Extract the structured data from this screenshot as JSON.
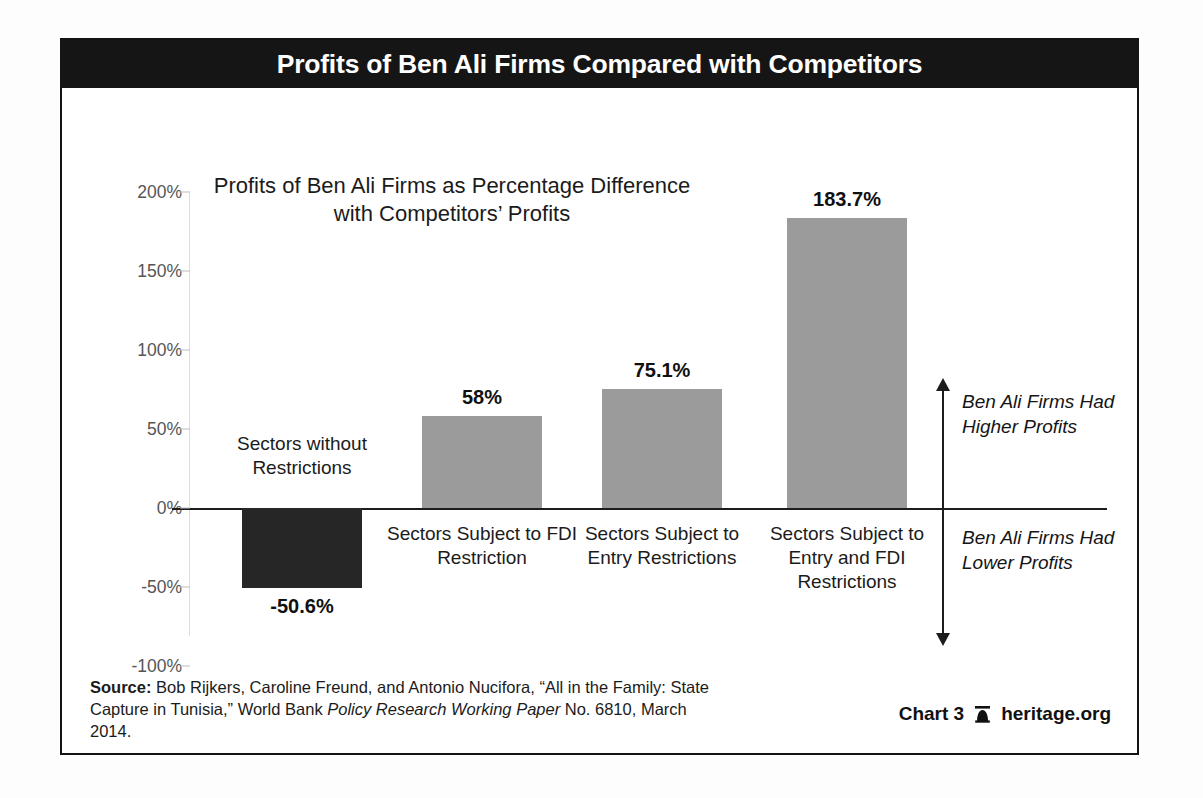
{
  "title": "Profits of Ben Ali Firms Compared with Competitors",
  "subtitle": "Profits of Ben Ali Firms as Percentage Difference with Competitors’ Profits",
  "annotations": {
    "upper": "Ben Ali Firms Had Higher Profits",
    "lower": "Ben Ali Firms Had Lower Profits",
    "arrow_up_icon": "arrow-up-icon",
    "arrow_down_icon": "arrow-down-icon"
  },
  "footer": {
    "source_label": "Source:",
    "source_text_1": " Bob Rijkers, Caroline Freund, and Antonio Nucifora, “All in the Family: State Capture in Tunisia,” World Bank ",
    "source_italic": "Policy Research Working Paper",
    "source_text_2": " No. 6810, March 2014.",
    "chart_number": "Chart 3",
    "site": "heritage.org",
    "bell_icon": "heritage-bell-icon"
  },
  "colors": {
    "banner": "#151515",
    "bar_positive": "#9b9b9b",
    "bar_negative": "#262626",
    "axis": "#1d1d1d",
    "gridline": "#dddddd",
    "tick_label": "#555555"
  },
  "chart_data": {
    "type": "bar",
    "title": "Profits of Ben Ali Firms Compared with Competitors",
    "subtitle": "Profits of Ben Ali Firms as Percentage Difference with Competitors’ Profits",
    "xlabel": "",
    "ylabel": "",
    "ylim": [
      -100,
      200
    ],
    "grid": false,
    "legend": "none",
    "ytick_labels": [
      "200%",
      "150%",
      "100%",
      "50%",
      "0%",
      "-50%",
      "-100%"
    ],
    "ytick_values": [
      200,
      150,
      100,
      50,
      0,
      -50,
      -100
    ],
    "categories": [
      "Sectors without Restrictions",
      "Sectors Subject to FDI Restriction",
      "Sectors Subject to Entry Restrictions",
      "Sectors Subject to Entry and FDI Restrictions"
    ],
    "values": [
      -50.6,
      58,
      75.1,
      183.7
    ],
    "value_labels": [
      "-50.6%",
      "58%",
      "75.1%",
      "183.7%"
    ],
    "bar_colors": [
      "#262626",
      "#9b9b9b",
      "#9b9b9b",
      "#9b9b9b"
    ]
  }
}
